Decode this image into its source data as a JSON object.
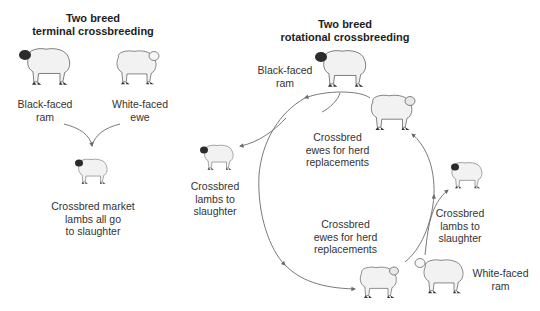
{
  "terminal": {
    "title": [
      "Two breed",
      "terminal crossbreeding"
    ],
    "sire": {
      "label": [
        "Black-faced",
        "ram"
      ],
      "icon": "black-faced-ram"
    },
    "dam": {
      "label": [
        "White-faced",
        "ewe"
      ],
      "icon": "white-faced-ewe"
    },
    "offspring": {
      "label": [
        "Crossbred market",
        "lambs all go",
        "to slaughter"
      ],
      "icon": "crossbred-lamb"
    }
  },
  "rotational": {
    "title": [
      "Two breed",
      "rotational crossbreeding"
    ],
    "sire_top": {
      "label": [
        "Black-faced",
        "ram"
      ],
      "icon": "black-faced-ram"
    },
    "ewes_upper": {
      "label": [
        "Crossbred",
        "ewes for herd",
        "replacements"
      ],
      "icon": "crossbred-ewe"
    },
    "lambs_left": {
      "label": [
        "Crossbred",
        "lambs to",
        "slaughter"
      ],
      "icon": "crossbred-lamb"
    },
    "ewes_lower": {
      "label": [
        "Crossbred",
        "ewes for herd",
        "replacements"
      ],
      "icon": "crossbred-ewe"
    },
    "lambs_right": {
      "label": [
        "Crossbred",
        "lambs to",
        "slaughter"
      ],
      "icon": "crossbred-lamb"
    },
    "sire_bottom": {
      "label": [
        "White-faced",
        "ram"
      ],
      "icon": "white-faced-ram"
    }
  },
  "colors": {
    "line": "#6a6a6a",
    "wool": "#f2f2f2",
    "face_dark": "#2b2b2b",
    "text": "#333333"
  }
}
